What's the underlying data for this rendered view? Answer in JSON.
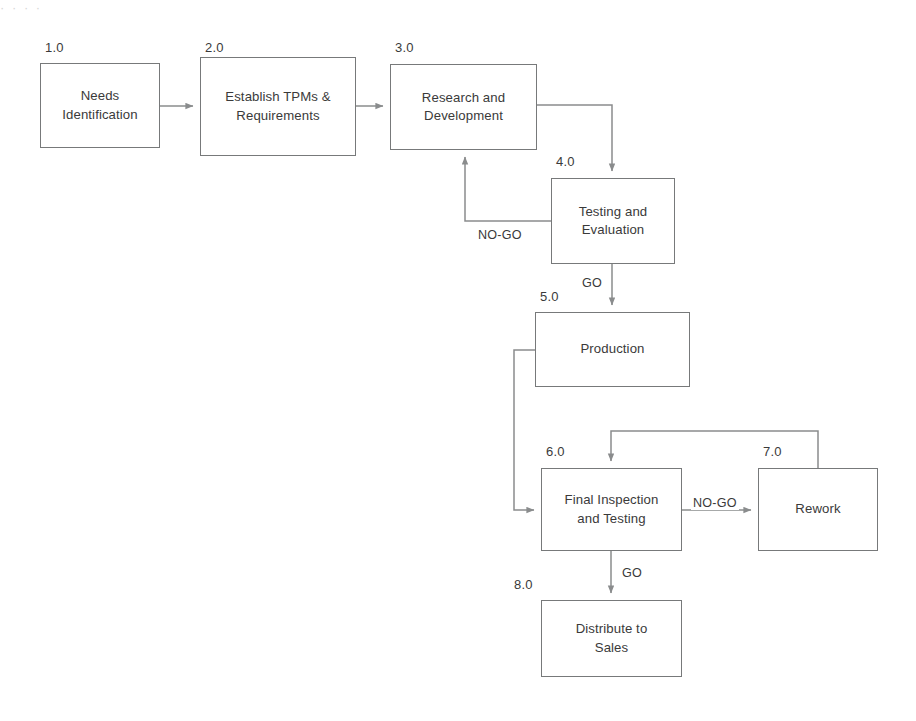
{
  "diagram": {
    "type": "flowchart",
    "background_color": "#ffffff",
    "line_color": "#8a8c8d",
    "border_color": "#77797a",
    "text_color": "#3a3a3a",
    "nodes": [
      {
        "id": "1.0",
        "label": "Needs\nIdentification",
        "x": 40,
        "y": 63,
        "w": 120,
        "h": 85
      },
      {
        "id": "2.0",
        "label": "Establish TPMs &\nRequirements",
        "x": 200,
        "y": 57,
        "w": 156,
        "h": 99
      },
      {
        "id": "3.0",
        "label": "Research and\nDevelopment",
        "x": 390,
        "y": 64,
        "w": 147,
        "h": 86
      },
      {
        "id": "4.0",
        "label": "Testing and\nEvaluation",
        "x": 551,
        "y": 178,
        "w": 124,
        "h": 86
      },
      {
        "id": "5.0",
        "label": "Production",
        "x": 535,
        "y": 312,
        "w": 155,
        "h": 75
      },
      {
        "id": "6.0",
        "label": "Final  Inspection\nand Testing",
        "x": 541,
        "y": 468,
        "w": 141,
        "h": 83
      },
      {
        "id": "7.0",
        "label": "Rework",
        "x": 758,
        "y": 468,
        "w": 120,
        "h": 83
      },
      {
        "id": "8.0",
        "label": "Distribute to\nSales",
        "x": 541,
        "y": 600,
        "w": 141,
        "h": 77
      }
    ],
    "edge_labels": [
      {
        "name": "no-go-testing",
        "text": "NO-GO",
        "x": 476,
        "y": 229
      },
      {
        "name": "go-testing",
        "text": "GO",
        "x": 580,
        "y": 277
      },
      {
        "name": "no-go-inspection",
        "text": "NO-GO",
        "x": 691,
        "y": 498
      },
      {
        "name": "go-inspection",
        "text": "GO",
        "x": 620,
        "y": 568
      }
    ],
    "edges": [
      {
        "from": "1.0",
        "to": "2.0",
        "kind": "straight-right"
      },
      {
        "from": "2.0",
        "to": "3.0",
        "kind": "straight-right"
      },
      {
        "from": "3.0",
        "to": "4.0",
        "kind": "elbow-right-down"
      },
      {
        "from": "4.0",
        "to": "3.0",
        "kind": "elbow-left-up",
        "label": "NO-GO"
      },
      {
        "from": "4.0",
        "to": "5.0",
        "kind": "straight-down",
        "label": "GO"
      },
      {
        "from": "5.0",
        "to": "6.0",
        "kind": "elbow-left-down-right"
      },
      {
        "from": "6.0",
        "to": "7.0",
        "kind": "straight-right",
        "label": "NO-GO"
      },
      {
        "from": "7.0",
        "to": "6.0",
        "kind": "elbow-up-left-down"
      },
      {
        "from": "6.0",
        "to": "8.0",
        "kind": "straight-down",
        "label": "GO"
      }
    ]
  },
  "artifact": {
    "top_strip": "·          ·            ·                    ·"
  }
}
